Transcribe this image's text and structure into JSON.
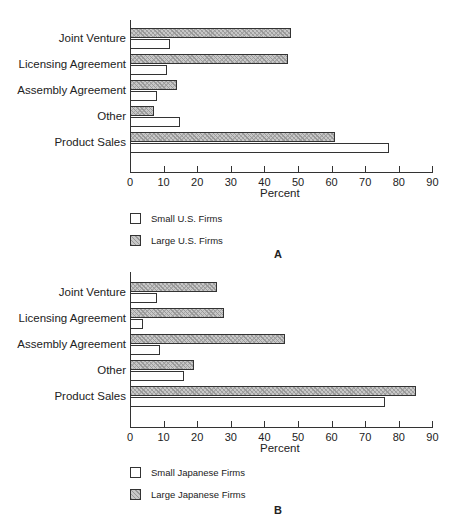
{
  "chart_data": [
    {
      "type": "bar",
      "orientation": "horizontal",
      "panel": "A",
      "categories": [
        "Joint Venture",
        "Licensing Agreement",
        "Assembly Agreement",
        "Other",
        "Product Sales"
      ],
      "series": [
        {
          "name": "Large U.S. Firms",
          "values": [
            48,
            47,
            14,
            7,
            61
          ],
          "style": "hatched"
        },
        {
          "name": "Small U.S. Firms",
          "values": [
            12,
            11,
            8,
            15,
            77
          ],
          "style": "white"
        }
      ],
      "xlabel": "Percent",
      "xlim": [
        0,
        90
      ],
      "xticks": [
        0,
        10,
        20,
        30,
        40,
        50,
        60,
        70,
        80,
        90
      ],
      "legend": [
        "Small U.S. Firms",
        "Large U.S. Firms"
      ],
      "grid": false
    },
    {
      "type": "bar",
      "orientation": "horizontal",
      "panel": "B",
      "categories": [
        "Joint Venture",
        "Licensing Agreement",
        "Assembly Agreement",
        "Other",
        "Product Sales"
      ],
      "series": [
        {
          "name": "Large Japanese Firms",
          "values": [
            26,
            28,
            46,
            19,
            85
          ],
          "style": "hatched"
        },
        {
          "name": "Small Japanese Firms",
          "values": [
            8,
            4,
            9,
            16,
            76
          ],
          "style": "white"
        }
      ],
      "xlabel": "Percent",
      "xlim": [
        0,
        90
      ],
      "xticks": [
        0,
        10,
        20,
        30,
        40,
        50,
        60,
        70,
        80,
        90
      ],
      "legend": [
        "Small Japanese Firms",
        "Large Japanese Firms"
      ],
      "grid": false
    }
  ],
  "panels": [
    {
      "label": "A",
      "xlabel": "Percent",
      "legend_small": "Small U.S. Firms",
      "legend_large": "Large U.S. Firms"
    },
    {
      "label": "B",
      "xlabel": "Percent",
      "legend_small": "Small Japanese Firms",
      "legend_large": "Large Japanese Firms"
    }
  ]
}
